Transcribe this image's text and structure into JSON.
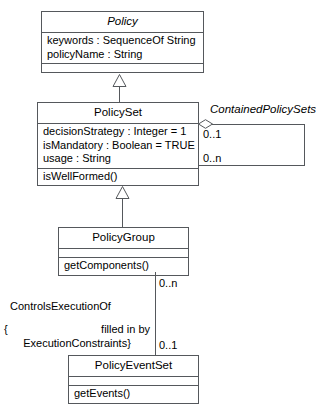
{
  "diagram": {
    "type": "uml-class-diagram",
    "background": "#ffffff",
    "line_color": "#55585c"
  },
  "classes": {
    "policy": {
      "name": "Policy",
      "abstract": true,
      "attributes": [
        "keywords : SequenceOf String",
        "policyName : String"
      ],
      "operations": []
    },
    "policyset": {
      "name": "PolicySet",
      "abstract": false,
      "attributes": [
        "decisionStrategy : Integer = 1",
        "isMandatory : Boolean = TRUE",
        "usage : String"
      ],
      "operations": [
        "isWellFormed()"
      ]
    },
    "policygroup": {
      "name": "PolicyGroup",
      "abstract": false,
      "attributes": [],
      "operations": [
        "getComponents()"
      ]
    },
    "policyeventset": {
      "name": "PolicyEventSet",
      "abstract": false,
      "attributes": [],
      "operations": [
        "getEvents()"
      ]
    }
  },
  "associations": {
    "contained_policy_sets": {
      "name": "ContainedPolicySets",
      "source_multiplicity": "0..1",
      "target_multiplicity": "0..n"
    },
    "controls_execution_of": {
      "name": "ControlsExecutionOf",
      "constraint_open": "{",
      "constraint_line1": "filled in by",
      "constraint_line2": "ExecutionConstraints}",
      "source_multiplicity": "0..n",
      "target_multiplicity": "0..1"
    }
  },
  "generalizations": {
    "policyset_to_policy": "generalization",
    "policygroup_to_policyset": "generalization"
  }
}
